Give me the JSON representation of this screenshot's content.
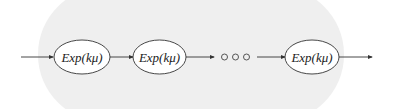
{
  "diagram": {
    "title": "",
    "nodes": [
      {
        "id": "n1",
        "label": "Exp(kμ)"
      },
      {
        "id": "n2",
        "label": "Exp(kμ)"
      },
      {
        "id": "ellipsis",
        "label": "○○○"
      },
      {
        "id": "n3",
        "label": "Exp(kμ)"
      }
    ],
    "edges": [
      {
        "from": "input",
        "to": "n1"
      },
      {
        "from": "n1",
        "to": "n2"
      },
      {
        "from": "n2",
        "to": "ellipsis"
      },
      {
        "from": "ellipsis",
        "to": "n3"
      },
      {
        "from": "n3",
        "to": "output"
      }
    ],
    "colors": {
      "stroke": "#333333",
      "background": "#efefef"
    }
  }
}
